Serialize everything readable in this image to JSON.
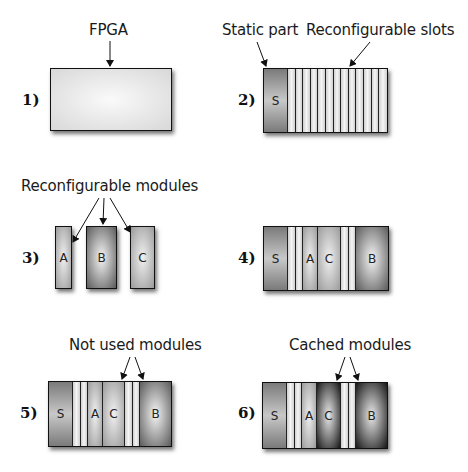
{
  "panels": [
    {
      "number": "1)",
      "caption": "FPGA"
    },
    {
      "number": "2)",
      "captions": [
        "Static part",
        "Reconfigurable slots"
      ],
      "segments": [
        "S"
      ]
    },
    {
      "number": "3)",
      "caption": "Reconfigurable modules",
      "modules": [
        "A",
        "B",
        "C"
      ]
    },
    {
      "number": "4)",
      "segments": [
        "S",
        "",
        "",
        "A",
        "C",
        "",
        "",
        "B"
      ]
    },
    {
      "number": "5)",
      "caption": "Not used modules",
      "segments": [
        "S",
        "",
        "",
        "A",
        "C",
        "",
        "",
        "B"
      ]
    },
    {
      "number": "6)",
      "caption": "Cached modules",
      "segments": [
        "S",
        "",
        "",
        "A",
        "C",
        "",
        "",
        "B"
      ]
    }
  ]
}
